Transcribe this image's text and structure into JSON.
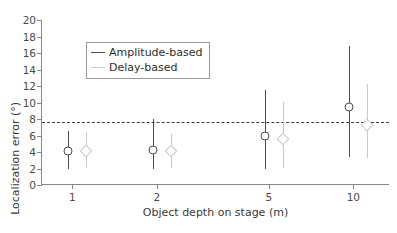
{
  "chart_data": {
    "type": "scatter",
    "title": "",
    "xlabel": "Object depth on stage (m)",
    "ylabel": "Localization error (°)",
    "xscale": "log",
    "xlim": [
      0.78,
      13.5
    ],
    "ylim": [
      0,
      20
    ],
    "yticks": [
      0,
      2,
      4,
      6,
      8,
      10,
      12,
      14,
      16,
      18,
      20
    ],
    "xticks": [
      1,
      2,
      5,
      10
    ],
    "xticklabels": [
      "1",
      "2",
      "5",
      "10"
    ],
    "grid": false,
    "legend_position": "upper-left",
    "x": [
      1,
      2,
      5,
      10
    ],
    "series": [
      {
        "name": "Amplitude-based",
        "color": "#4d4d4d",
        "marker": "circle",
        "values": [
          4.1,
          4.3,
          5.9,
          9.4
        ],
        "err_low": [
          2.0,
          2.0,
          2.0,
          3.4
        ],
        "err_high": [
          6.5,
          8.0,
          11.5,
          16.8
        ]
      },
      {
        "name": "Delay-based",
        "color": "#c9c9c9",
        "marker": "diamond",
        "values": [
          4.1,
          4.1,
          5.6,
          7.3
        ],
        "err_low": [
          2.0,
          2.0,
          2.1,
          3.3
        ],
        "err_high": [
          6.4,
          6.2,
          10.1,
          12.3
        ]
      }
    ],
    "reference_line": {
      "value": 7.6,
      "style": "dashed",
      "color": "#3c3c3c"
    }
  },
  "legend": {
    "items": [
      {
        "label": "Amplitude-based"
      },
      {
        "label": "Delay-based"
      }
    ]
  }
}
